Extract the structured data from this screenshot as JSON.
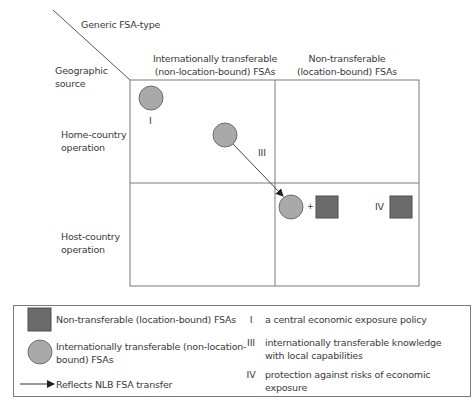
{
  "diagram": {
    "corner": {
      "column_axis_label": "Generic FSA-type",
      "row_axis_label_line1": "Geographic",
      "row_axis_label_line2": "source"
    },
    "columns": [
      {
        "line1": "Internationally transferable",
        "line2": "(non-location-bound) FSAs"
      },
      {
        "line1": "Non-transferable",
        "line2": "(location-bound) FSAs"
      }
    ],
    "rows": [
      {
        "line1": "Home-country",
        "line2": "operation"
      },
      {
        "line1": "Host-country",
        "line2": "operation"
      }
    ],
    "markers": {
      "I": "I",
      "III": "III",
      "IV": "IV",
      "plus": "+"
    },
    "colors": {
      "circle_fill": "#a9a9a9",
      "circle_stroke": "#6e6e6e",
      "square_fill": "#6b6b6b",
      "square_stroke": "#4e4e4e",
      "grid_line": "#7a7a7a"
    }
  },
  "legend": {
    "symbols": [
      {
        "shape": "square",
        "label": "Non-transferable (location-bound) FSAs"
      },
      {
        "shape": "circle",
        "label_line1": "Internationally transferable (non-location-",
        "label_line2": "bound) FSAs"
      },
      {
        "shape": "arrow",
        "label": "Reflects NLB FSA transfer"
      }
    ],
    "keys": [
      {
        "numeral": "I",
        "text": "a central economic exposure policy"
      },
      {
        "numeral": "III",
        "text_line1": "internationally transferable knowledge",
        "text_line2": "with local capabilities"
      },
      {
        "numeral": "IV",
        "text": "protection against risks of economic exposure"
      }
    ]
  }
}
